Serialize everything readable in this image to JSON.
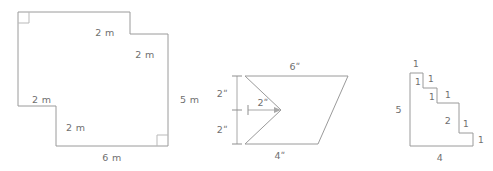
{
  "figure": {
    "stroke_color": "#9a9a9a",
    "label_color": "#6f6f6f",
    "background_color": "#ffffff"
  },
  "shapes": [
    {
      "id": "shape-1",
      "name": "notched-rectangle-meters",
      "units": "m",
      "right_angle_markers": 2,
      "labels": [
        {
          "key": "s1_top_notch_v",
          "text": "2 m"
        },
        {
          "key": "s1_notch_h",
          "text": "2 m"
        },
        {
          "key": "s1_right",
          "text": "5 m"
        },
        {
          "key": "s1_left_notch_h",
          "text": "2 m"
        },
        {
          "key": "s1_left_notch_v",
          "text": "2 m"
        },
        {
          "key": "s1_bottom",
          "text": "6 m"
        }
      ]
    },
    {
      "id": "shape-2",
      "name": "arrow-notched-parallelogram-inches",
      "units": "ʺ",
      "labels": [
        {
          "key": "s2_top",
          "text": "6ʺ"
        },
        {
          "key": "s2_left_upper",
          "text": "2ʺ"
        },
        {
          "key": "s2_notch",
          "text": "2ʺ"
        },
        {
          "key": "s2_left_lower",
          "text": "2ʺ"
        },
        {
          "key": "s2_bottom",
          "text": "4ʺ"
        }
      ]
    },
    {
      "id": "shape-3",
      "name": "staircase-polygon-unitless",
      "units": "",
      "labels": [
        {
          "key": "s3_step1_top",
          "text": "1"
        },
        {
          "key": "s3_step1_rise",
          "text": "1"
        },
        {
          "key": "s3_step2_top",
          "text": "1"
        },
        {
          "key": "s3_step2_rise",
          "text": "1"
        },
        {
          "key": "s3_step3_top",
          "text": "1"
        },
        {
          "key": "s3_left",
          "text": "5"
        },
        {
          "key": "s3_step3_rise",
          "text": "2"
        },
        {
          "key": "s3_step4_top",
          "text": "1"
        },
        {
          "key": "s3_step4_rise",
          "text": "1"
        },
        {
          "key": "s3_bottom",
          "text": "4"
        }
      ]
    }
  ]
}
